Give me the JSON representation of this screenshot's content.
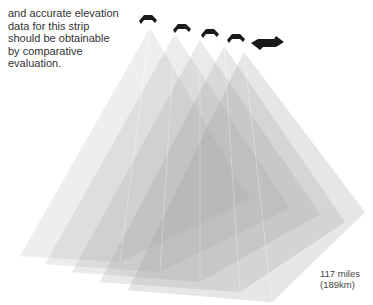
{
  "caption": {
    "lines": [
      "and accurate elevation",
      "data for this strip",
      "should be obtainable",
      "by comparative",
      "evaluation."
    ]
  },
  "dimension_label": {
    "line1": "117 miles",
    "line2": "(189km)"
  },
  "diagram": {
    "satellite_count": 4,
    "icons": [
      "satellite-icon",
      "satellite-icon",
      "satellite-icon",
      "satellite-icon",
      "direction-arrow-icon"
    ],
    "colors": {
      "frustum_fill": "#9a9a9a",
      "icon": "#1a1a1a",
      "text": "#333333"
    }
  }
}
